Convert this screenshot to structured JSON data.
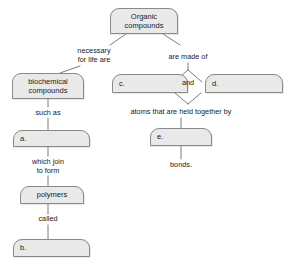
{
  "diagram": {
    "type": "concept-map",
    "title_node": "Organic compounds",
    "nodes": [
      {
        "id": "organic",
        "label": "Organic\ncompounds",
        "x": 110,
        "y": 8,
        "w": 68,
        "h": 26,
        "align": "center"
      },
      {
        "id": "biochemical",
        "label": "biochemical\ncompounds",
        "x": 12,
        "y": 73,
        "w": 72,
        "h": 26,
        "align": "center"
      },
      {
        "id": "blank_a",
        "label": "a.",
        "x": 13,
        "y": 130,
        "w": 77,
        "h": 17,
        "align": "left"
      },
      {
        "id": "polymers",
        "label": "polymers",
        "x": 20,
        "y": 186,
        "w": 64,
        "h": 18,
        "align": "center"
      },
      {
        "id": "blank_b",
        "label": "b.",
        "x": 13,
        "y": 239,
        "w": 77,
        "h": 18,
        "align": "left"
      },
      {
        "id": "blank_c",
        "label": "c.",
        "x": 112,
        "y": 74,
        "w": 76,
        "h": 19,
        "align": "left"
      },
      {
        "id": "blank_d",
        "label": "d.",
        "x": 205,
        "y": 74,
        "w": 78,
        "h": 19,
        "align": "left"
      },
      {
        "id": "blank_e",
        "label": "e.",
        "x": 150,
        "y": 128,
        "w": 62,
        "h": 18,
        "align": "left"
      }
    ],
    "connector_labels": [
      {
        "id": "necessary",
        "text": "necessary\nfor life are",
        "x": 61,
        "y": 46,
        "w": 66
      },
      {
        "id": "are_made",
        "text": "are made of",
        "x": 157,
        "y": 52,
        "w": 62
      },
      {
        "id": "such_as",
        "text": "such as",
        "x": 25,
        "y": 108,
        "w": 52
      },
      {
        "id": "which_join",
        "text": "which join\nto form",
        "x": 25,
        "y": 157,
        "w": 52
      },
      {
        "id": "called",
        "text": "called",
        "x": 26,
        "y": 215,
        "w": 52
      },
      {
        "id": "and",
        "text": "and",
        "x": 182,
        "y": 78,
        "w": 24
      },
      {
        "id": "atoms",
        "text": "atoms that are held together by",
        "x": 110,
        "y": 108,
        "w": 142
      },
      {
        "id": "bonds",
        "text": "bonds.",
        "x": 155,
        "y": 161,
        "w": 52
      }
    ],
    "edges": [
      {
        "id": "organic-to-necessary",
        "from": "organic",
        "to": "necessary"
      },
      {
        "id": "organic-to-are-made",
        "from": "organic",
        "to": "are_made"
      },
      {
        "id": "necessary-to-biochem",
        "from": "necessary",
        "to": "biochemical"
      },
      {
        "id": "biochem-to-suchas",
        "from": "biochemical",
        "to": "such_as"
      },
      {
        "id": "suchas-to-a",
        "from": "such_as",
        "to": "blank_a"
      },
      {
        "id": "a-to-whichjoin",
        "from": "blank_a",
        "to": "which_join"
      },
      {
        "id": "whichjoin-to-polymers",
        "from": "which_join",
        "to": "polymers"
      },
      {
        "id": "polymers-to-called",
        "from": "polymers",
        "to": "called"
      },
      {
        "id": "called-to-b",
        "from": "called",
        "to": "blank_b"
      },
      {
        "id": "aremade-to-c",
        "from": "are_made",
        "to": "blank_c"
      },
      {
        "id": "aremade-to-d",
        "from": "are_made",
        "to": "blank_d"
      },
      {
        "id": "c-to-atoms",
        "from": "blank_c",
        "to": "atoms"
      },
      {
        "id": "d-to-atoms",
        "from": "blank_d",
        "to": "atoms"
      },
      {
        "id": "atoms-to-e",
        "from": "atoms",
        "to": "blank_e"
      },
      {
        "id": "e-to-bonds",
        "from": "blank_e",
        "to": "bonds"
      }
    ],
    "colors": {
      "node_fill": "#e9e9e9",
      "node_border": "#8a8a8a",
      "line": "#6e6e6e",
      "text": "#1a1a1a",
      "background": "#ffffff"
    }
  }
}
